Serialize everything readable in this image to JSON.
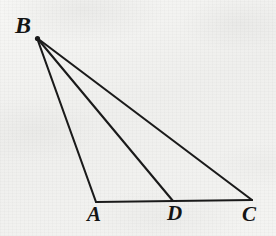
{
  "figure": {
    "kind": "geometry-diagram",
    "background_color": "#f2f2f0",
    "stroke_color": "#1a1a1a",
    "stroke_width": 2,
    "canvas": {
      "width": 276,
      "height": 236
    },
    "points": [
      {
        "id": "B",
        "label": "B",
        "x": 37,
        "y": 38,
        "label_x": 15,
        "label_y": 13
      },
      {
        "id": "A",
        "label": "A",
        "x": 96,
        "y": 202,
        "label_x": 87,
        "label_y": 204
      },
      {
        "id": "D",
        "label": "D",
        "x": 173,
        "y": 201,
        "label_x": 167,
        "label_y": 203
      },
      {
        "id": "C",
        "label": "C",
        "x": 252,
        "y": 200,
        "label_x": 242,
        "label_y": 204
      }
    ],
    "segments": [
      {
        "id": "BA",
        "from": "B",
        "to": "A",
        "name": "segment-ba"
      },
      {
        "id": "BD",
        "from": "B",
        "to": "D",
        "name": "segment-bd"
      },
      {
        "id": "BC",
        "from": "B",
        "to": "C",
        "name": "segment-bc"
      },
      {
        "id": "AC",
        "from": "A",
        "to": "C",
        "name": "segment-ac"
      }
    ]
  }
}
